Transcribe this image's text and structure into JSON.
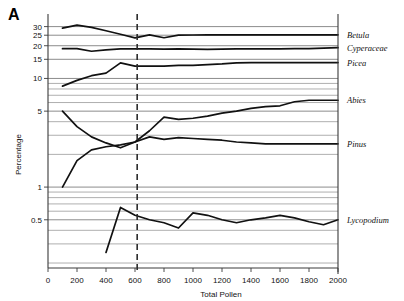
{
  "figure": {
    "panel_letter": "A"
  },
  "chart_data": {
    "type": "line",
    "title": "",
    "xlabel": "Total Pollen",
    "ylabel": "Percentage",
    "yscale": "log",
    "ylim": [
      0.18,
      36
    ],
    "xlim": [
      0,
      2000
    ],
    "grid": true,
    "legend_position": "right-outside",
    "xticks": [
      0,
      200,
      400,
      600,
      800,
      1000,
      1200,
      1400,
      1600,
      1800,
      2000
    ],
    "xticklabels": [
      "0",
      "200",
      "400",
      "600",
      "800",
      "1000",
      "1200",
      "1400",
      "1600",
      "1800",
      "2000"
    ],
    "yticks_labeled": [
      0.5,
      1,
      5,
      10,
      15,
      20,
      25,
      30
    ],
    "yticklabels": [
      "0.5",
      "1",
      "5",
      "10",
      "15",
      "20",
      "25",
      "30"
    ],
    "yticks_minor": [
      0.2,
      0.3,
      0.4,
      0.6,
      0.7,
      0.8,
      0.9,
      2,
      3,
      4,
      6,
      7,
      8,
      9
    ],
    "annotations": [
      {
        "name": "threshold-line",
        "type": "vline",
        "x": 615,
        "style": "dashed"
      }
    ],
    "series": [
      {
        "name": "Betula",
        "label": "Betula",
        "x": [
          100,
          200,
          300,
          400,
          500,
          600,
          700,
          800,
          900,
          1000,
          1100,
          1200,
          1300,
          1400,
          1500,
          1600,
          1700,
          1800,
          1900,
          2000
        ],
        "values": [
          29.0,
          31.0,
          29.5,
          27.5,
          25.5,
          23.6,
          25.2,
          23.7,
          25.0,
          25.1,
          25.2,
          25.2,
          25.2,
          25.2,
          25.2,
          25.2,
          25.2,
          25.2,
          25.2,
          25.2
        ]
      },
      {
        "name": "Cyperaceae",
        "label": "Cyperaceae",
        "x": [
          100,
          200,
          300,
          400,
          500,
          600,
          700,
          800,
          900,
          1000,
          1100,
          1200,
          1300,
          1400,
          1500,
          1600,
          1700,
          1800,
          1900,
          2000
        ],
        "values": [
          18.8,
          18.8,
          17.8,
          18.3,
          18.7,
          18.7,
          18.7,
          18.6,
          18.7,
          18.6,
          18.5,
          18.6,
          18.7,
          18.7,
          18.7,
          18.7,
          18.8,
          18.8,
          19.0,
          19.2
        ]
      },
      {
        "name": "Picea",
        "label": "Picea",
        "x": [
          100,
          200,
          300,
          400,
          500,
          600,
          700,
          800,
          900,
          1000,
          1100,
          1200,
          1300,
          1400,
          1500,
          1600,
          1700,
          1800,
          1900,
          2000
        ],
        "values": [
          8.5,
          9.6,
          10.6,
          11.2,
          13.9,
          13.0,
          13.0,
          13.0,
          13.2,
          13.2,
          13.4,
          13.6,
          13.9,
          14.0,
          14.0,
          14.0,
          14.0,
          14.0,
          14.0,
          14.0
        ]
      },
      {
        "name": "Abies",
        "label": "Abies",
        "x": [
          100,
          200,
          300,
          400,
          500,
          600,
          700,
          800,
          900,
          1000,
          1100,
          1200,
          1300,
          1400,
          1500,
          1600,
          1700,
          1800,
          1900,
          2000
        ],
        "values": [
          5.0,
          3.6,
          2.9,
          2.55,
          2.3,
          2.6,
          3.3,
          4.4,
          4.2,
          4.3,
          4.5,
          4.8,
          5.0,
          5.3,
          5.5,
          5.6,
          6.1,
          6.3,
          6.3,
          6.3
        ]
      },
      {
        "name": "Pinus",
        "label": "Pinus",
        "x": [
          100,
          200,
          300,
          400,
          500,
          600,
          700,
          800,
          900,
          1000,
          1100,
          1200,
          1300,
          1400,
          1500,
          1600,
          1700,
          1800,
          1900,
          2000
        ],
        "values": [
          1.0,
          1.75,
          2.2,
          2.35,
          2.45,
          2.6,
          2.9,
          2.75,
          2.85,
          2.8,
          2.75,
          2.7,
          2.6,
          2.55,
          2.5,
          2.5,
          2.5,
          2.5,
          2.5,
          2.5
        ]
      },
      {
        "name": "Lycopodium",
        "label": "Lycopodium",
        "x": [
          400,
          500,
          600,
          700,
          800,
          900,
          1000,
          1100,
          1200,
          1300,
          1400,
          1500,
          1600,
          1700,
          1800,
          1900,
          2000
        ],
        "values": [
          0.25,
          0.65,
          0.55,
          0.5,
          0.47,
          0.42,
          0.58,
          0.55,
          0.5,
          0.47,
          0.5,
          0.52,
          0.55,
          0.52,
          0.48,
          0.45,
          0.5
        ]
      }
    ]
  }
}
